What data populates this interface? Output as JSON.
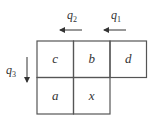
{
  "diagram": {
    "title": "",
    "cells": [
      {
        "label": "c",
        "row": 0,
        "col": 0
      },
      {
        "label": "b",
        "row": 0,
        "col": 1
      },
      {
        "label": "d",
        "row": 0,
        "col": 2
      },
      {
        "label": "a",
        "row": 1,
        "col": 0
      },
      {
        "label": "x",
        "row": 1,
        "col": 1
      }
    ],
    "arrows": [
      {
        "name": "q2",
        "label": "q",
        "subscript": "2",
        "direction": "left"
      },
      {
        "name": "q1",
        "label": "q",
        "subscript": "1",
        "direction": "left"
      },
      {
        "name": "q3",
        "label": "q",
        "subscript": "3",
        "direction": "down"
      }
    ],
    "colors": {
      "line": "#555555",
      "text": "#333333",
      "background": "#ffffff"
    }
  }
}
